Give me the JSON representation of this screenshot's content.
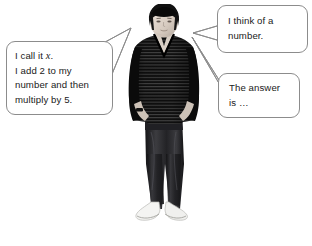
{
  "scene": {
    "background_color": "#ffffff",
    "bubble_border_color": "#8c8c8c",
    "text_color": "#1a1a1a",
    "width": 312,
    "height": 246
  },
  "person": {
    "description": "young man standing, hands in pockets",
    "hair_color": "#1a1a1a",
    "skin_color": "#d8cdc4",
    "sweater_color": "#111111",
    "sweater_stripe_color": "#4a4a4a",
    "jeans_color": "#2a2a2c",
    "shoes_color": "#f2f2f0"
  },
  "bubbles": {
    "left": {
      "name": "method-bubble",
      "lines": [
        "I call it ",
        ".",
        "I add 2 to my",
        "number and then",
        "multiply by 5."
      ],
      "line1_prefix": "I call it ",
      "line1_variable": "x",
      "line1_suffix": ".",
      "line2": "I add 2 to my",
      "line3": "number and then",
      "line4": "multiply by 5."
    },
    "top_right": {
      "name": "think-bubble",
      "line1": "I think of a",
      "line2": "number."
    },
    "bottom_right": {
      "name": "answer-bubble",
      "line1": "The answer",
      "line2": "is …"
    }
  }
}
